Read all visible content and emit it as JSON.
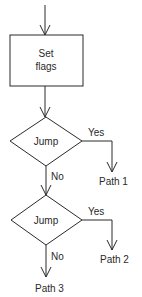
{
  "diagram": {
    "type": "flowchart",
    "process": {
      "line1": "Set",
      "line2": "flags"
    },
    "decision1": {
      "label": "Jump",
      "yes": "Yes",
      "no": "No",
      "yes_target": "Path 1"
    },
    "decision2": {
      "label": "Jump",
      "yes": "Yes",
      "no": "No",
      "yes_target": "Path 2",
      "no_target": "Path 3"
    }
  },
  "colors": {
    "line": "#2a2a2a",
    "background": "#ffffff"
  }
}
